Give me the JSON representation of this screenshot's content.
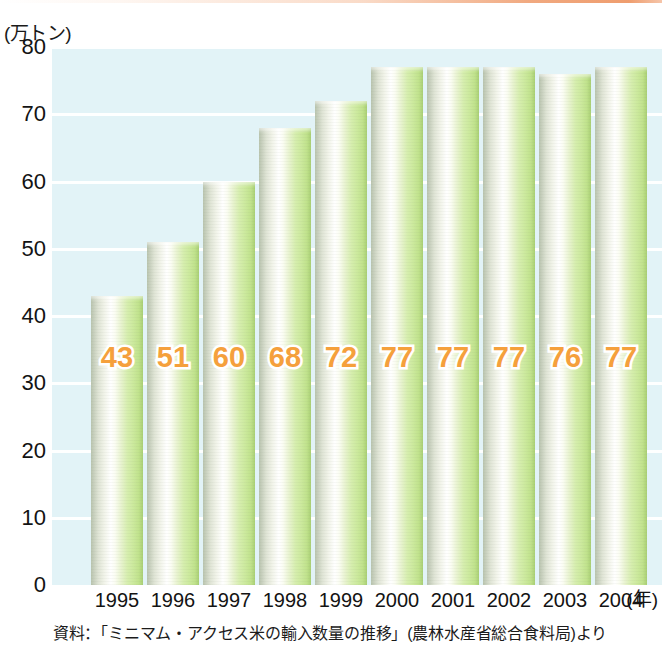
{
  "chart_data": {
    "type": "bar",
    "title": "",
    "subtitle": "",
    "unit_label": "(万トン)",
    "xlabel": "(年)",
    "ylabel": "",
    "categories": [
      "1995",
      "1996",
      "1997",
      "1998",
      "1999",
      "2000",
      "2001",
      "2002",
      "2003",
      "2004"
    ],
    "values": [
      43,
      51,
      60,
      68,
      72,
      77,
      77,
      77,
      76,
      77
    ],
    "value_labels": [
      "43",
      "51",
      "60",
      "68",
      "72",
      "77",
      "77",
      "77",
      "76",
      "77"
    ],
    "ylim": [
      0,
      80
    ],
    "yticks": [
      "80",
      "70",
      "60",
      "50",
      "40",
      "30",
      "20",
      "10",
      "0"
    ],
    "ytick_values": [
      80,
      70,
      60,
      50,
      40,
      30,
      20,
      10,
      0
    ],
    "grid": true,
    "legend": "none",
    "series": [
      {
        "name": "ミニマム・アクセス米の輸入数量",
        "values": [
          43,
          51,
          60,
          68,
          72,
          77,
          77,
          77,
          76,
          77
        ]
      }
    ],
    "colors": {
      "plot_background": "#e2f3f7",
      "gridline": "#ffffff",
      "bar_light": "#ffffff",
      "bar_green": "#cbe99c",
      "bar_edge": "#b9c4ae",
      "value_label": "#f5a03c",
      "text": "#131313",
      "top_rule": "#ec8c55"
    }
  },
  "source": {
    "note": "資料：「ミニマム・アクセス米の輸入数量の推移」(農林水産省総合食料局)より"
  }
}
